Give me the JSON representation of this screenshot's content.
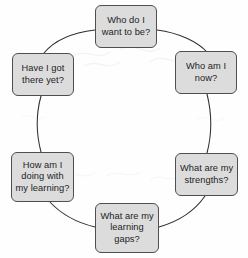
{
  "diagram": {
    "type": "cycle",
    "direction": "clockwise",
    "node_fill_color": "#dcdcdc",
    "node_border_color": "#4f4f4f",
    "text_color": "#1c1c1c",
    "connector_color": "#2e2e2e",
    "background_color": "#fefefe",
    "nodes": [
      {
        "id": "who-do-i-want-to-be",
        "position": "top",
        "label": "Who do I\nwant to be?"
      },
      {
        "id": "who-am-i-now",
        "position": "upper-right",
        "label": "Who am I\nnow?"
      },
      {
        "id": "what-are-my-strengths",
        "position": "lower-right",
        "label": "What are my\nstrengths?"
      },
      {
        "id": "what-are-my-learning-gaps",
        "position": "bottom",
        "label": "What are my\nlearning\ngaps?"
      },
      {
        "id": "how-am-i-doing-with-my-learning",
        "position": "lower-left",
        "label": "How am I\ndoing with\nmy learning?"
      },
      {
        "id": "have-i-got-there-yet",
        "position": "upper-left",
        "label": "Have I got\nthere yet?"
      }
    ]
  }
}
